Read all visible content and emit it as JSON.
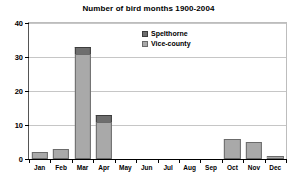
{
  "chart_data": {
    "type": "bar",
    "title": "Number of bird months 1900-2004",
    "subtitle": "",
    "xlabel": "",
    "ylabel": "",
    "stacked": true,
    "grid": true,
    "legend_position": "inside-top-center",
    "ylim": [
      0,
      40
    ],
    "yticks": [
      0,
      10,
      20,
      30,
      40
    ],
    "ytick_labels": [
      "0",
      "10",
      "20",
      "30",
      "40"
    ],
    "categories": [
      "Jan",
      "Feb",
      "Mar",
      "Apr",
      "May",
      "Jun",
      "Jul",
      "Aug",
      "Sep",
      "Oct",
      "Nov",
      "Dec"
    ],
    "series": [
      {
        "name": "Vice-county",
        "color": "#a9a9a9",
        "values": [
          2,
          3,
          31,
          11,
          0,
          0,
          0,
          0,
          0,
          6,
          5,
          1
        ]
      },
      {
        "name": "Spelthorne",
        "color": "#6e6e6e",
        "values": [
          0,
          0,
          2,
          2,
          0,
          0,
          0,
          0,
          0,
          0,
          0,
          0
        ]
      }
    ],
    "totals": [
      2,
      3,
      33,
      13,
      0,
      0,
      0,
      0,
      0,
      6,
      5,
      1
    ]
  },
  "legend": {
    "entries": [
      {
        "label": "Spelthorne",
        "color": "#6e6e6e"
      },
      {
        "label": "Vice-county",
        "color": "#a9a9a9"
      }
    ]
  },
  "colors": {
    "spelthorne": "#6e6e6e",
    "vice_county": "#a9a9a9",
    "gridline": "#c6c6c6",
    "axis": "#000000",
    "background": "#ffffff"
  }
}
